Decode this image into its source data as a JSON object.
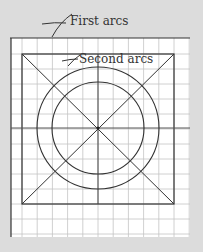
{
  "labels": {
    "first_arcs": "First arcs",
    "second_arcs": "Second arcs"
  },
  "colors": {
    "background": "#dcdcdc",
    "paper": "#ffffff",
    "grid": "#c4c4c4",
    "ink": "#333333"
  },
  "diagram": {
    "grid_cells": 12,
    "circles": 2
  }
}
